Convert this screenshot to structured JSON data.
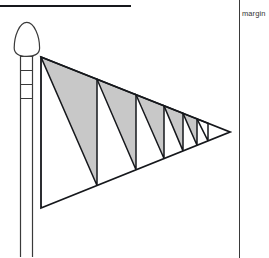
{
  "page": {
    "width": 269,
    "height": 258,
    "background": "#ffffff",
    "type": "technical-line-drawing"
  },
  "annotations": {
    "margin_label": "margin"
  },
  "colors": {
    "ink": "#16181c",
    "line": "#3a3a3a",
    "shade_fill": "#c8c8c8",
    "paper": "#ffffff"
  },
  "drawing": {
    "title": "pennant-flag-on-pole",
    "pole": {
      "name": "flagpole",
      "x_left": 20,
      "x_right": 33,
      "y_top": 47,
      "y_bottom": 258,
      "band_count": 4,
      "band_y": [
        56,
        70,
        84,
        98
      ]
    },
    "finial": {
      "name": "pole-finial",
      "shape": "onion-bullet",
      "cx": 27,
      "top_y": 22,
      "base_y": 56,
      "half_width": 14
    },
    "flag": {
      "name": "pennant-flag",
      "hoist_top": [
        41,
        57
      ],
      "hoist_bottom": [
        41,
        208
      ],
      "fly_tip": [
        230,
        132
      ],
      "panel_count": 6,
      "shaded_panels": 6,
      "divider_x": [
        41,
        97,
        136,
        164,
        183,
        197,
        208
      ],
      "stripes": [
        {
          "index": 1,
          "filled": true
        },
        {
          "index": 2,
          "filled": true
        },
        {
          "index": 3,
          "filled": true
        },
        {
          "index": 4,
          "filled": true
        },
        {
          "index": 5,
          "filled": true
        },
        {
          "index": 6,
          "filled": false
        }
      ]
    }
  }
}
